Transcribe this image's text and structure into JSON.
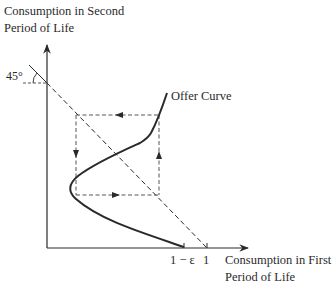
{
  "diagram": {
    "y_axis_label_line1": "Consumption in Second",
    "y_axis_label_line2": "Period of Life",
    "x_axis_label_line1": "Consumption in First",
    "x_axis_label_line2": "Period of Life",
    "angle_label": "45°",
    "curve_label": "Offer Curve",
    "x_tick_1_label": "1 − ε",
    "x_tick_2_label": "1",
    "colors": {
      "ink": "#2a2a2a",
      "dashed": "#555555"
    }
  }
}
